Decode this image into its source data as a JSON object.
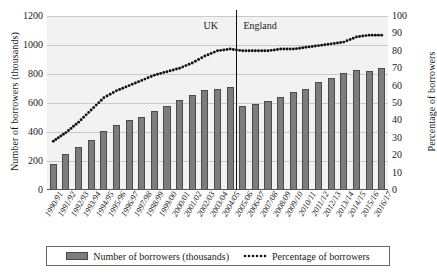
{
  "chart_data": {
    "type": "bar",
    "title": "",
    "xlabel": "",
    "ylabel": "Number of borrowers (thousands)",
    "y2label": "Percentage of borrowers",
    "ylim": [
      0,
      1200
    ],
    "y2lim": [
      0,
      100
    ],
    "yticks": [
      0,
      200,
      400,
      600,
      800,
      1000,
      1200
    ],
    "y2ticks": [
      0,
      10,
      20,
      30,
      40,
      50,
      60,
      70,
      80,
      90,
      100
    ],
    "grid": true,
    "legend_position": "bottom",
    "categories": [
      "1990/91",
      "1991/92",
      "1992/93",
      "1993/94",
      "1994/95",
      "1995/96",
      "1996/97",
      "1997/98",
      "1998/99",
      "1999/00",
      "2000/01",
      "2001/02",
      "2002/03",
      "2003/04",
      "2004/05",
      "2005/06",
      "2006/07",
      "2007/08",
      "2008/09",
      "2009/10",
      "2010/11",
      "2011/12",
      "2012/13",
      "2013/14",
      "2014/15",
      "2015/16",
      "2016/17"
    ],
    "series": [
      {
        "name": "Number of borrowers (thousands)",
        "type": "bar",
        "axis": "left",
        "values": [
          180,
          250,
          295,
          345,
          410,
          445,
          480,
          505,
          545,
          580,
          620,
          655,
          690,
          700,
          710,
          580,
          590,
          615,
          640,
          675,
          700,
          745,
          775,
          805,
          830,
          820,
          840
        ]
      },
      {
        "name": "Percentage of borrowers",
        "type": "line",
        "axis": "right",
        "values": [
          28,
          33,
          39,
          46,
          53,
          57,
          60,
          63,
          66,
          68,
          70,
          73,
          77,
          80,
          81,
          80,
          80,
          80,
          81,
          81,
          82,
          83,
          84,
          85,
          88,
          89,
          89
        ]
      }
    ],
    "annotations": [
      {
        "label": "UK",
        "position": "left-of-divider"
      },
      {
        "label": "England",
        "position": "right-of-divider"
      }
    ],
    "divider_after_category": "2004/05",
    "colors": {
      "bar_fill": "#7d7d7d",
      "bar_edge": "#4a4a4a",
      "line": "#111111",
      "plot_background": "#f2f2f2",
      "gridline": "#c9c9c9"
    }
  }
}
